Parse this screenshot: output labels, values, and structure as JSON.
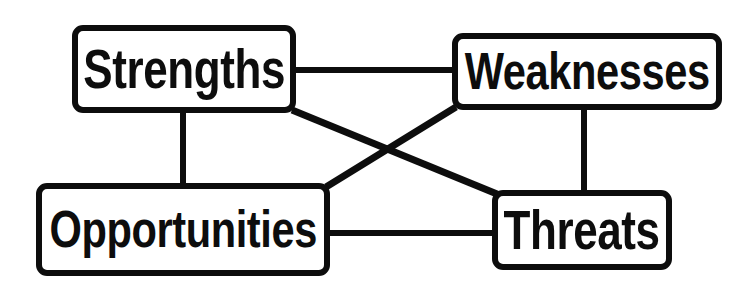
{
  "diagram": {
    "type": "swot-matrix",
    "background_color": "#ffffff",
    "stroke_color": "#0d0d0d",
    "fill_color": "#ffffff",
    "border_width_px": 6,
    "corner_radius_px": 11,
    "canvas": {
      "width": 751,
      "height": 300
    },
    "nodes": [
      {
        "id": "strengths",
        "label": "Strengths",
        "x": 72,
        "y": 25,
        "width": 224,
        "height": 88,
        "quadrant": "internal-positive"
      },
      {
        "id": "weaknesses",
        "label": "Weaknesses",
        "x": 452,
        "y": 33,
        "width": 270,
        "height": 77,
        "quadrant": "internal-negative"
      },
      {
        "id": "opportunities",
        "label": "Opportunities",
        "x": 36,
        "y": 183,
        "width": 294,
        "height": 93,
        "quadrant": "external-positive"
      },
      {
        "id": "threats",
        "label": "Threats",
        "x": 492,
        "y": 190,
        "width": 180,
        "height": 80,
        "quadrant": "external-negative"
      }
    ],
    "connectors": [
      {
        "id": "strengths-weaknesses",
        "from": "strengths",
        "to": "weaknesses",
        "style": "horizontal",
        "x1": 290,
        "y1": 70,
        "x2": 458,
        "y2": 70,
        "stroke_width": 6
      },
      {
        "id": "strengths-opportunities",
        "from": "strengths",
        "to": "opportunities",
        "style": "vertical",
        "x1": 183,
        "y1": 108,
        "x2": 183,
        "y2": 188,
        "stroke_width": 6
      },
      {
        "id": "weaknesses-threats",
        "from": "weaknesses",
        "to": "threats",
        "style": "vertical",
        "x1": 584,
        "y1": 105,
        "x2": 584,
        "y2": 195,
        "stroke_width": 6
      },
      {
        "id": "opportunities-threats",
        "from": "opportunities",
        "to": "threats",
        "style": "horizontal",
        "x1": 325,
        "y1": 233,
        "x2": 498,
        "y2": 233,
        "stroke_width": 6
      },
      {
        "id": "strengths-threats",
        "from": "strengths",
        "to": "threats",
        "style": "diagonal",
        "x1": 292,
        "y1": 110,
        "x2": 497,
        "y2": 194,
        "stroke_width": 7
      },
      {
        "id": "weaknesses-opportunities",
        "from": "weaknesses",
        "to": "opportunities",
        "style": "diagonal",
        "x1": 456,
        "y1": 107,
        "x2": 326,
        "y2": 187,
        "stroke_width": 7
      }
    ]
  }
}
